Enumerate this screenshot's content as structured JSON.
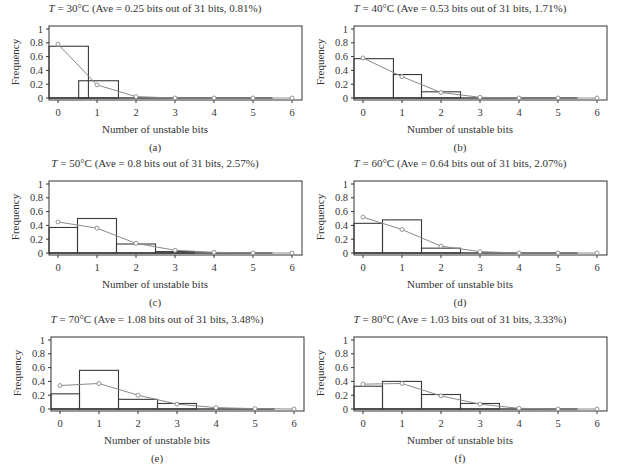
{
  "figure": {
    "xlabel": "Number of unstable bits",
    "ylabel": "Frequency",
    "yticks": [
      "0",
      "0.2",
      "0.4",
      "0.6",
      "0.8",
      "1"
    ],
    "xticks": [
      "0",
      "1",
      "2",
      "3",
      "4",
      "5",
      "6"
    ]
  },
  "panels": [
    {
      "caption": "(a)",
      "title_var": "T",
      "title_rest": " = 30°C (Ave = 0.25 bits out of 31 bits, 0.81%)"
    },
    {
      "caption": "(b)",
      "title_var": "T",
      "title_rest": " = 40°C (Ave = 0.53 bits out of 31 bits, 1.71%)"
    },
    {
      "caption": "(c)",
      "title_var": "T",
      "title_rest": " = 50°C (Ave = 0.8 bits out of 31 bits, 2.57%)"
    },
    {
      "caption": "(d)",
      "title_var": "T",
      "title_rest": " = 60°C (Ave = 0.64 bits out of 31 bits, 2.07%)"
    },
    {
      "caption": "(e)",
      "title_var": "T",
      "title_rest": " = 70°C (Ave = 1.08 bits out of 31 bits, 3.48%)"
    },
    {
      "caption": "(f)",
      "title_var": "T",
      "title_rest": " = 80°C (Ave = 1.03 bits out of 31 bits, 3.33%)"
    }
  ],
  "chart_data": [
    {
      "type": "bar",
      "panel": "(a)",
      "title": "T = 30°C (Ave = 0.25 bits out of 31 bits, 0.81%)",
      "xlabel": "Number of unstable bits",
      "ylabel": "Frequency",
      "ylim": [
        0,
        1
      ],
      "xlim": [
        -0.25,
        6.25
      ],
      "grid": false,
      "bars": [
        {
          "x0": -0.25,
          "x1": 0.78,
          "value": 0.75
        },
        {
          "x0": 0.53,
          "x1": 1.55,
          "value": 0.25
        }
      ],
      "series": [
        {
          "name": "histogram",
          "categories": [
            0,
            1
          ],
          "values": [
            0.75,
            0.25
          ]
        },
        {
          "name": "fitted distribution",
          "x": [
            0,
            1,
            2,
            3,
            4,
            5,
            6
          ],
          "values": [
            0.78,
            0.19,
            0.02,
            0.0,
            0.0,
            0.0,
            0.0
          ]
        }
      ]
    },
    {
      "type": "bar",
      "panel": "(b)",
      "title": "T = 40°C (Ave = 0.53 bits out of 31 bits, 1.71%)",
      "xlabel": "Number of unstable bits",
      "ylabel": "Frequency",
      "ylim": [
        0,
        1
      ],
      "xlim": [
        -0.25,
        6.25
      ],
      "grid": false,
      "bars": [
        {
          "x0": -0.25,
          "x1": 0.78,
          "value": 0.57
        },
        {
          "x0": 0.78,
          "x1": 1.5,
          "value": 0.34
        },
        {
          "x0": 1.5,
          "x1": 2.5,
          "value": 0.09
        }
      ],
      "series": [
        {
          "name": "histogram",
          "categories": [
            0,
            1,
            2
          ],
          "values": [
            0.57,
            0.34,
            0.09
          ]
        },
        {
          "name": "fitted distribution",
          "x": [
            0,
            1,
            2,
            3,
            4,
            5,
            6
          ],
          "values": [
            0.58,
            0.31,
            0.08,
            0.01,
            0.0,
            0.0,
            0.0
          ]
        }
      ]
    },
    {
      "type": "bar",
      "panel": "(c)",
      "title": "T = 50°C (Ave = 0.8 bits out of 31 bits, 2.57%)",
      "xlabel": "Number of unstable bits",
      "ylabel": "Frequency",
      "ylim": [
        0,
        1
      ],
      "xlim": [
        -0.25,
        6.25
      ],
      "grid": false,
      "bars": [
        {
          "x0": -0.25,
          "x1": 0.5,
          "value": 0.37
        },
        {
          "x0": 0.5,
          "x1": 1.5,
          "value": 0.5
        },
        {
          "x0": 1.5,
          "x1": 2.5,
          "value": 0.13
        },
        {
          "x0": 2.5,
          "x1": 3.5,
          "value": 0.02
        }
      ],
      "series": [
        {
          "name": "histogram",
          "categories": [
            0,
            1,
            2,
            3
          ],
          "values": [
            0.37,
            0.5,
            0.13,
            0.02
          ]
        },
        {
          "name": "fitted distribution",
          "x": [
            0,
            1,
            2,
            3,
            4,
            5,
            6
          ],
          "values": [
            0.45,
            0.36,
            0.14,
            0.04,
            0.01,
            0.0,
            0.0
          ]
        }
      ]
    },
    {
      "type": "bar",
      "panel": "(d)",
      "title": "T = 60°C (Ave = 0.64 bits out of 31 bits, 2.07%)",
      "xlabel": "Number of unstable bits",
      "ylabel": "Frequency",
      "ylim": [
        0,
        1
      ],
      "xlim": [
        -0.25,
        6.25
      ],
      "grid": false,
      "bars": [
        {
          "x0": -0.25,
          "x1": 0.5,
          "value": 0.43
        },
        {
          "x0": 0.5,
          "x1": 1.5,
          "value": 0.48
        },
        {
          "x0": 1.5,
          "x1": 2.5,
          "value": 0.07
        }
      ],
      "series": [
        {
          "name": "histogram",
          "categories": [
            0,
            1,
            2
          ],
          "values": [
            0.43,
            0.48,
            0.07
          ]
        },
        {
          "name": "fitted distribution",
          "x": [
            0,
            1,
            2,
            3,
            4,
            5,
            6
          ],
          "values": [
            0.52,
            0.34,
            0.1,
            0.02,
            0.0,
            0.0,
            0.0
          ]
        }
      ]
    },
    {
      "type": "bar",
      "panel": "(e)",
      "title": "T = 70°C (Ave = 1.08 bits out of 31 bits, 3.48%)",
      "xlabel": "Number of unstable bits",
      "ylabel": "Frequency",
      "ylim": [
        0,
        1
      ],
      "xlim": [
        -0.25,
        6.25
      ],
      "grid": false,
      "bars": [
        {
          "x0": -0.25,
          "x1": 0.5,
          "value": 0.22
        },
        {
          "x0": 0.5,
          "x1": 1.5,
          "value": 0.56
        },
        {
          "x0": 1.5,
          "x1": 2.5,
          "value": 0.14
        },
        {
          "x0": 2.5,
          "x1": 3.5,
          "value": 0.08
        }
      ],
      "series": [
        {
          "name": "histogram",
          "categories": [
            0,
            1,
            2,
            3
          ],
          "values": [
            0.22,
            0.56,
            0.14,
            0.08
          ]
        },
        {
          "name": "fitted distribution",
          "x": [
            0,
            1,
            2,
            3,
            4,
            5,
            6
          ],
          "values": [
            0.34,
            0.37,
            0.2,
            0.07,
            0.02,
            0.005,
            0.0
          ]
        }
      ]
    },
    {
      "type": "bar",
      "panel": "(f)",
      "title": "T = 80°C (Ave = 1.03 bits out of 31 bits, 3.33%)",
      "xlabel": "Number of unstable bits",
      "ylabel": "Frequency",
      "ylim": [
        0,
        1
      ],
      "xlim": [
        -0.25,
        6.25
      ],
      "grid": false,
      "bars": [
        {
          "x0": -0.25,
          "x1": 0.5,
          "value": 0.33
        },
        {
          "x0": 0.5,
          "x1": 1.5,
          "value": 0.4
        },
        {
          "x0": 1.5,
          "x1": 2.5,
          "value": 0.21
        },
        {
          "x0": 2.5,
          "x1": 3.5,
          "value": 0.08
        }
      ],
      "series": [
        {
          "name": "histogram",
          "categories": [
            0,
            1,
            2,
            3
          ],
          "values": [
            0.33,
            0.4,
            0.21,
            0.08
          ]
        },
        {
          "name": "fitted distribution",
          "x": [
            0,
            1,
            2,
            3,
            4,
            5,
            6
          ],
          "values": [
            0.36,
            0.37,
            0.19,
            0.07,
            0.01,
            0.0,
            0.0
          ]
        }
      ]
    }
  ],
  "layout": {
    "panel_origins": [
      [
        0,
        0
      ],
      [
        305,
        0
      ],
      [
        0,
        155
      ],
      [
        305,
        155
      ],
      [
        2,
        311
      ],
      [
        305,
        311
      ]
    ],
    "plot_box": {
      "left": 49,
      "right": 302,
      "top": 26,
      "y1": 29,
      "y0": 98,
      "bottom": 100,
      "x0": 58,
      "dx": 39
    }
  },
  "colors": {
    "axis": "#333333",
    "bar_edge": "#3a3a3a",
    "curve": "#8a8a8a",
    "marker": "#8a8a8a"
  }
}
